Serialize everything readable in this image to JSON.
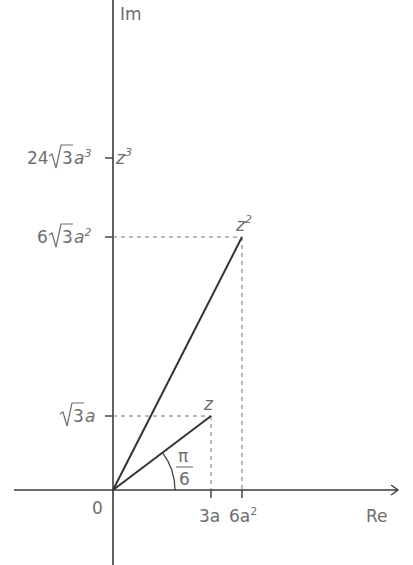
{
  "diagram": {
    "type": "complex-plane",
    "axes": {
      "real_label": "Re",
      "imag_label": "Im",
      "origin_label": "0"
    },
    "points": [
      {
        "name": "z",
        "label": "z",
        "sup": "",
        "re": "3a",
        "im": "√3a"
      },
      {
        "name": "z2",
        "label": "z",
        "sup": "2",
        "re": "6a²",
        "im": "6√3a²"
      },
      {
        "name": "z3",
        "label": "z",
        "sup": "3",
        "re": "0",
        "im": "24√3a³"
      }
    ],
    "x_ticks": [
      {
        "label": "3a",
        "base": "3a",
        "sup": ""
      },
      {
        "label": "6a²",
        "base": "6a",
        "sup": "2"
      }
    ],
    "y_ticks": [
      {
        "coef": "",
        "root": "3",
        "var": "a",
        "sup": ""
      },
      {
        "coef": "6",
        "root": "3",
        "var": "a",
        "sup": "2"
      },
      {
        "coef": "24",
        "root": "3",
        "var": "a",
        "sup": "3"
      }
    ],
    "angle": {
      "numerator": "π",
      "denominator": "6"
    }
  }
}
